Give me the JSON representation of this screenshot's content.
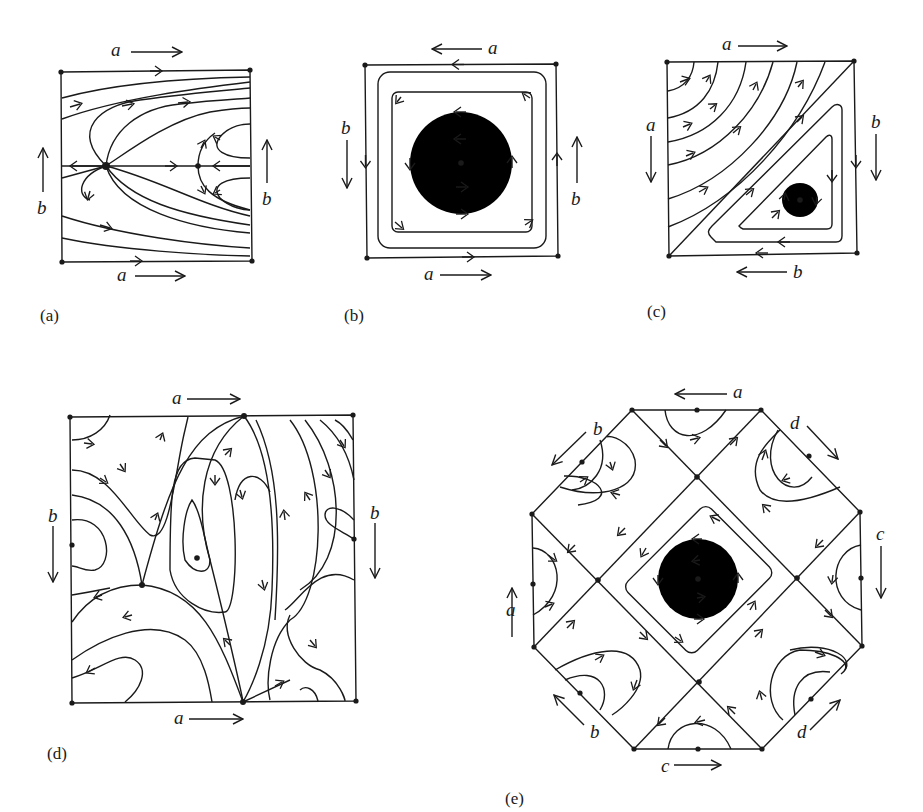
{
  "figure": {
    "panels": [
      {
        "id": "a",
        "caption": "(a)",
        "edge_labels": {
          "top": "a",
          "bottom": "a",
          "left": "b",
          "right": "b"
        },
        "edge_directions": {
          "top": "right",
          "bottom": "right",
          "left": "up",
          "right": "up"
        }
      },
      {
        "id": "b",
        "caption": "(b)",
        "edge_labels": {
          "top": "a",
          "bottom": "a",
          "left": "b",
          "right": "b"
        },
        "edge_directions": {
          "top": "left",
          "bottom": "right",
          "left": "down",
          "right": "up"
        }
      },
      {
        "id": "c",
        "caption": "(c)",
        "edge_labels": {
          "top": "a",
          "bottom": "b",
          "left": "a",
          "right": "b"
        },
        "edge_directions": {
          "top": "right",
          "bottom": "left",
          "left": "down",
          "right": "down"
        }
      },
      {
        "id": "d",
        "caption": "(d)",
        "edge_labels": {
          "top": "a",
          "bottom": "a",
          "left": "b",
          "right": "b"
        },
        "edge_directions": {
          "top": "right",
          "bottom": "right",
          "left": "down",
          "right": "down"
        }
      },
      {
        "id": "e",
        "caption": "(e)",
        "edge_labels": {
          "top": "a",
          "upper_left": "b",
          "upper_right": "d",
          "left": "a",
          "right": "c",
          "lower_left": "b",
          "lower_right": "d",
          "bottom": "c"
        },
        "edge_directions": {
          "top": "left",
          "upper_left": "down-left",
          "upper_right": "down-right",
          "left": "up",
          "right": "down",
          "lower_left": "up-left",
          "lower_right": "up-right",
          "bottom": "right"
        }
      }
    ]
  }
}
